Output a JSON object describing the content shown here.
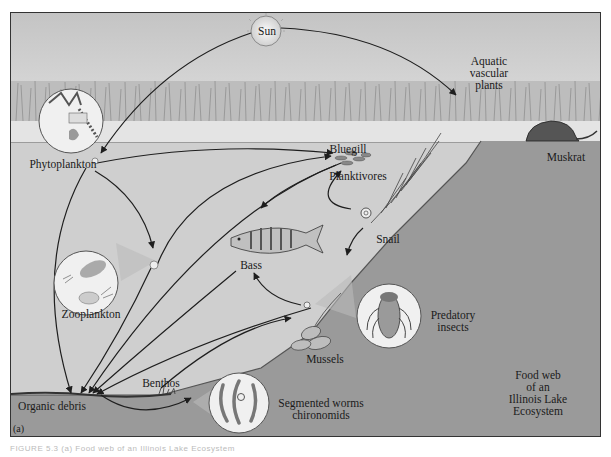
{
  "figure": {
    "panel_label": "(a)",
    "title": "Food web of an Illinois Lake Ecosystem",
    "title_lines": [
      "Food web",
      "of an",
      "Illinois Lake",
      "Ecosystem"
    ],
    "caption": "FIGURE 5.3 (a) Food web of an Illinois Lake Ecosystem"
  },
  "nodes": {
    "sun": "Sun",
    "aquatic_plants": [
      "Aquatic",
      "vascular",
      "plants"
    ],
    "phytoplankton": "Phytoplankton",
    "bluegill": "Bluegill",
    "planktivores": "Planktivores",
    "muskrat": "Muskrat",
    "snail": "Snail",
    "bass": "Bass",
    "zooplankton": "Zooplankton",
    "predatory_insects": [
      "Predatory",
      "insects"
    ],
    "mussels": "Mussels",
    "benthos": "Benthos",
    "organic_debris": "Organic debris",
    "segmented_worms": [
      "Segmented worms",
      "chironomids"
    ]
  },
  "colors": {
    "sky": "#d8d8d8",
    "water": "#cfcfcf",
    "land": "#9a9a9a",
    "arrow": "#1e1e1e",
    "inset_circle": "#f2f2f2"
  },
  "edges": [
    {
      "from": "Sun",
      "to": "Aquatic vascular plants"
    },
    {
      "from": "Sun",
      "to": "Phytoplankton"
    },
    {
      "from": "Phytoplankton",
      "to": "Bluegill"
    },
    {
      "from": "Phytoplankton",
      "to": "Zooplankton"
    },
    {
      "from": "Phytoplankton",
      "to": "Organic debris"
    },
    {
      "from": "Zooplankton",
      "to": "Bluegill"
    },
    {
      "from": "Zooplankton",
      "to": "Organic debris"
    },
    {
      "from": "Bluegill",
      "to": "Bass"
    },
    {
      "from": "Bluegill",
      "to": "Organic debris"
    },
    {
      "from": "Snail",
      "to": "Predatory insects"
    },
    {
      "from": "Snail",
      "to": "Bluegill"
    },
    {
      "from": "Predatory insects",
      "to": "Bass"
    },
    {
      "from": "Bass",
      "to": "Organic debris"
    },
    {
      "from": "Predatory insects",
      "to": "Organic debris"
    },
    {
      "from": "Organic debris",
      "to": "Benthos"
    },
    {
      "from": "Organic debris",
      "to": "Mussels"
    }
  ]
}
